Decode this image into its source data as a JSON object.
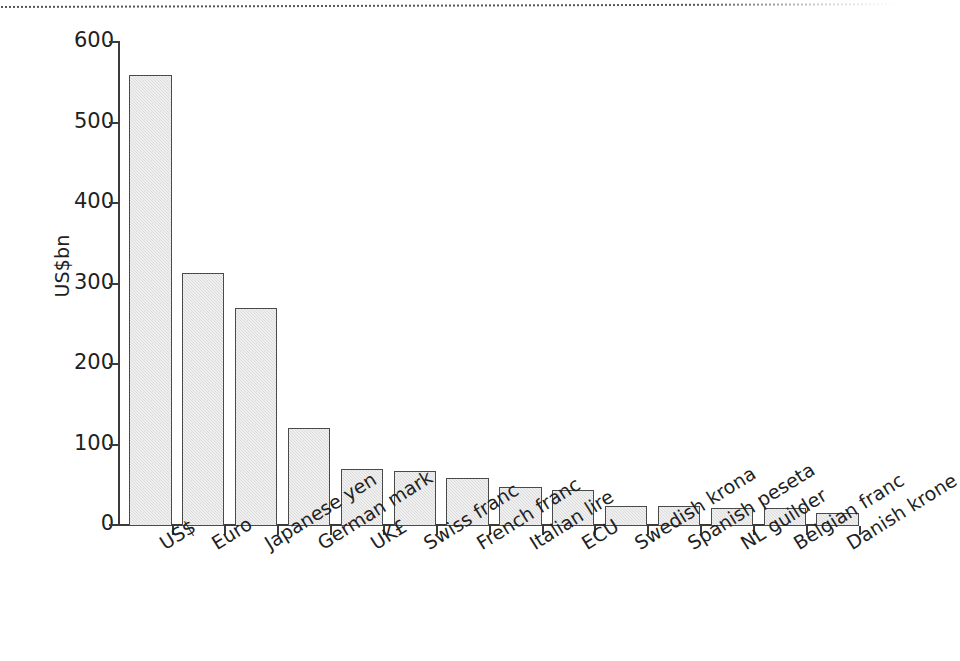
{
  "chart_data": {
    "type": "bar",
    "title": "",
    "subtitle": "",
    "xlabel": "",
    "ylabel": "US$bn",
    "ylim": [
      0,
      600
    ],
    "yticks": [
      0,
      100,
      200,
      300,
      400,
      500,
      600
    ],
    "ytick_labels": [
      "0",
      "100",
      "200",
      "300",
      "400",
      "500",
      "600"
    ],
    "grid": false,
    "legend": null,
    "legend_position": "none",
    "bar_fill_color": "#dcdcdc",
    "bar_edge_color": "#4a4a4a",
    "axis_color": "#3b3b3b",
    "background_color": "#ffffff",
    "categories": [
      "US$",
      "Euro",
      "Japanese yen",
      "German mark",
      "UK£",
      "Swiss franc",
      "French franc",
      "Italian lire",
      "ECU",
      "Swedish krona",
      "Spanish peseta",
      "NL guilder",
      "Belgian franc",
      "Danish krone"
    ],
    "values": [
      560,
      314,
      271,
      122,
      71,
      68,
      60,
      49,
      45,
      25,
      25,
      22,
      22,
      16
    ],
    "annotations": []
  },
  "artifacts": {
    "top_dotted_scan_line": true
  }
}
